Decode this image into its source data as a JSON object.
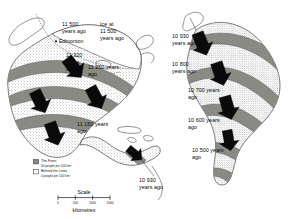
{
  "figure": {
    "panels": [
      {
        "id": "north-america",
        "name": "North and Central America",
        "labels": [
          {
            "id": "na-11500",
            "lines": [
              "11 500",
              "years ago"
            ],
            "x": 62,
            "y": 26
          },
          {
            "id": "na-ice-11500",
            "lines": [
              "Ice at",
              "11 500",
              "years ago"
            ],
            "x": 100,
            "y": 26
          },
          {
            "id": "na-edmonton",
            "lines": [
              "Edmonton"
            ],
            "x": 58,
            "y": 43,
            "marker": "city-dot"
          },
          {
            "id": "na-11320",
            "lines": [
              "11 320",
              "years",
              "ago"
            ],
            "x": 66,
            "y": 57
          },
          {
            "id": "na-11250",
            "lines": [
              "11 250 years",
              "ago"
            ],
            "x": 88,
            "y": 69
          },
          {
            "id": "na-11150",
            "lines": [
              "11 150 years",
              "ago"
            ],
            "x": 77,
            "y": 126
          },
          {
            "id": "na-10930",
            "lines": [
              "10 930",
              "years ago"
            ],
            "x": 139,
            "y": 182
          }
        ]
      },
      {
        "id": "south-america",
        "name": "South America",
        "labels": [
          {
            "id": "sa-10930",
            "lines": [
              "10 930",
              "years ago"
            ],
            "x": 172,
            "y": 38
          },
          {
            "id": "sa-10800",
            "lines": [
              "10 800",
              "years ago"
            ],
            "x": 172,
            "y": 66
          },
          {
            "id": "sa-10700",
            "lines": [
              "10 700 years",
              "ago"
            ],
            "x": 188,
            "y": 92
          },
          {
            "id": "sa-10600",
            "lines": [
              "10 600 years",
              "ago"
            ],
            "x": 188,
            "y": 122
          },
          {
            "id": "sa-10500",
            "lines": [
              "10 500 years",
              "ago"
            ],
            "x": 192,
            "y": 152
          }
        ]
      }
    ],
    "legend": {
      "name": "population-density-legend",
      "entries": [
        {
          "id": "the-front",
          "swatch": "filled",
          "title": "The Front",
          "subtitle": "40 people per 100 km²"
        },
        {
          "id": "behind-the-lines",
          "swatch": "empty",
          "title": "Behind the Lines",
          "subtitle": "4 people per 100 km²"
        }
      ]
    },
    "scale": {
      "name": "distance-scale-bar",
      "title": "Scale",
      "ticks": [
        "0",
        "500",
        "1000",
        "1500"
      ],
      "unit": "kilometres"
    },
    "colors": {
      "band_fill": "#8c8c86",
      "land_fill": "#ffffff",
      "arrow": "#0a0a0a",
      "outline": "#2b2b2b",
      "background": "#ffffff"
    }
  }
}
